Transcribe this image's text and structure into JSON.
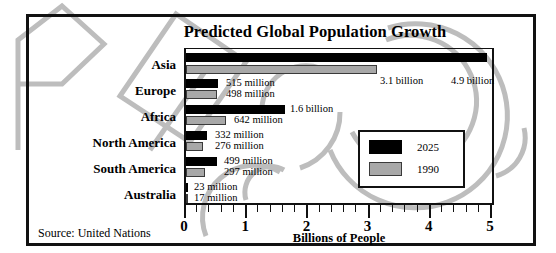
{
  "chart_data": {
    "type": "bar",
    "orientation": "horizontal",
    "title": "Predicted Global Population Growth",
    "xlabel": "Billions of People",
    "ylabel": "",
    "xlim": [
      0,
      5
    ],
    "xticks": [
      0,
      1,
      2,
      3,
      4,
      5
    ],
    "xtick_labels": [
      "0",
      "1",
      "2",
      "3",
      "4",
      "5"
    ],
    "minor_tick_step": 0.2,
    "grid": false,
    "legend_position": "center-right",
    "categories": [
      "Asia",
      "Europe",
      "Africa",
      "North America",
      "South America",
      "Australia"
    ],
    "series": [
      {
        "name": "2025",
        "color": "#000000",
        "values": [
          4.9,
          0.515,
          1.6,
          0.332,
          0.499,
          0.023
        ],
        "labels": [
          "4.9 billion",
          "515 million",
          "1.6 billion",
          "332 million",
          "499 million",
          "23 million"
        ]
      },
      {
        "name": "1990",
        "color": "#a8a8a8",
        "values": [
          3.1,
          0.498,
          0.642,
          0.276,
          0.297,
          0.017
        ],
        "labels": [
          "3.1 billion",
          "498 million",
          "642 million",
          "276 million",
          "297 million",
          "17 million"
        ]
      }
    ],
    "source_note": "Source:  United Nations"
  },
  "legend": {
    "items": [
      {
        "label": "2025",
        "swatch": "black"
      },
      {
        "label": "1990",
        "swatch": "gray"
      }
    ]
  },
  "source": {
    "text": "Source:  United Nations"
  },
  "watermark": {
    "text": "PREVIEW-COPY",
    "color": "#b9b9b9"
  }
}
